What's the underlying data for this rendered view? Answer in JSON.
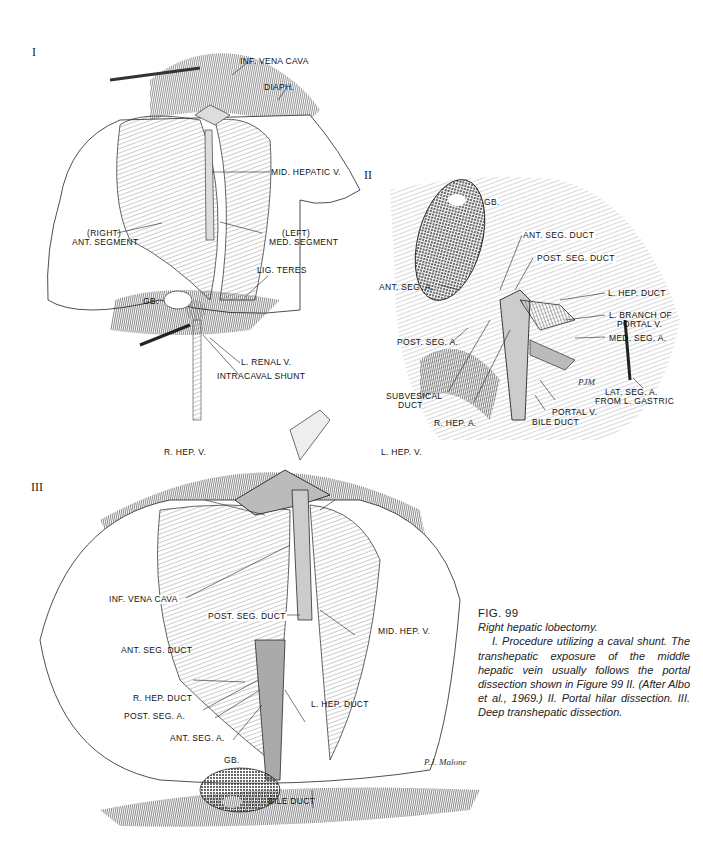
{
  "panels": {
    "I": {
      "number": "I",
      "labels": {
        "inf_vena_cava": "INF. VENA CAVA",
        "diaph": "DIAPH.",
        "mid_hepatic_v": "MID. HEPATIC V.",
        "right_1": "(RIGHT)",
        "right_2": "ANT. SEGMENT",
        "left_1": "(LEFT)",
        "left_2": "MED. SEGMENT",
        "lig_teres": "LIG. TERES",
        "gb": "GB.",
        "l_renal_v": "L. RENAL V.",
        "intracaval_shunt": "INTRACAVAL SHUNT"
      }
    },
    "II": {
      "number": "II",
      "labels": {
        "gb": "GB.",
        "ant_seg_duct": "ANT. SEG. DUCT",
        "post_seg_duct": "POST. SEG. DUCT",
        "ant_seg_a": "ANT. SEG. A.",
        "l_hep_duct": "L. HEP. DUCT",
        "l_branch_1": "L. BRANCH OF",
        "l_branch_2": "PORTAL V.",
        "med_seg_a": "MED. SEG. A.",
        "post_seg_a": "POST. SEG. A.",
        "subvesical_1": "SUBVESICAL",
        "subvesical_2": "DUCT",
        "r_hep_a": "R. HEP. A.",
        "portal_v": "PORTAL V.",
        "bile_duct": "BILE DUCT",
        "lat_seg_1": "LAT. SEG. A.",
        "lat_seg_2": "FROM L. GASTRIC",
        "signature": "PJM"
      }
    },
    "III": {
      "number": "III",
      "labels": {
        "r_hep_v": "R. HEP. V.",
        "l_hep_v": "L. HEP. V.",
        "inf_vena_cava": "INF. VENA CAVA",
        "post_seg_duct": "POST. SEG. DUCT",
        "mid_hep_v": "MID. HEP. V.",
        "ant_seg_duct": "ANT. SEG. DUCT",
        "r_hep_duct": "R. HEP. DUCT",
        "post_seg_a": "POST. SEG. A.",
        "l_hep_duct": "L. HEP. DUCT",
        "ant_seg_a": "ANT. SEG. A.",
        "gb": "GB.",
        "bile_duct": "BILE DUCT",
        "signature": "P.J. Malone"
      }
    }
  },
  "caption": {
    "figure": "FIG. 99",
    "title": "Right hepatic lobectomy.",
    "body": "I. Procedure utilizing a caval shunt. The transhepatic exposure of the middle hepatic vein usually follows the portal dissection shown in Figure 99 II. (After Albo et al., 1969.) II. Portal hilar dissection. III. Deep transhepatic dissection."
  }
}
